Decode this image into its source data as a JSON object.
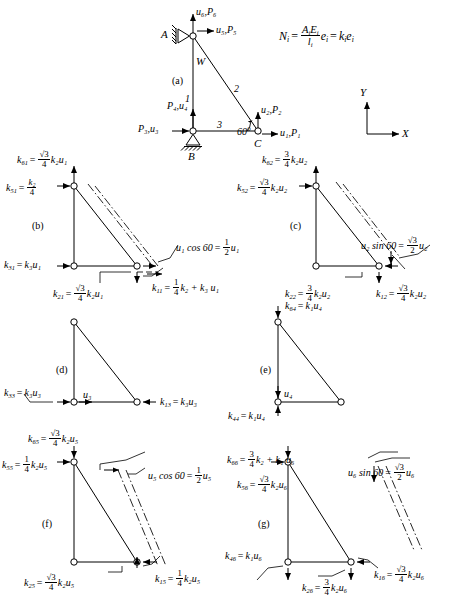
{
  "figure": {
    "axes": {
      "x_label": "X",
      "y_label": "Y"
    },
    "formula": {
      "lhs": "N",
      "lhs_sub": "i",
      "num": "A",
      "num_sub": "i",
      "num2": "E",
      "num2_sub": "i",
      "den": "l",
      "den_sub": "i",
      "mid": "e",
      "mid_sub": "i",
      "rhs": "k",
      "rhs_sub": "i",
      "rhs2": "e",
      "rhs2_sub": "i",
      "plain": "N_i = (A_i E_i / l_i) e_i = k_i e_i"
    },
    "panels": [
      {
        "tag": "(a)",
        "name": "truss-geometry"
      },
      {
        "tag": "(b)",
        "name": "unit-displacement-u1"
      },
      {
        "tag": "(c)",
        "name": "unit-displacement-u2"
      },
      {
        "tag": "(d)",
        "name": "unit-displacement-u3"
      },
      {
        "tag": "(e)",
        "name": "unit-displacement-u4"
      },
      {
        "tag": "(f)",
        "name": "unit-displacement-u5"
      },
      {
        "tag": "(g)",
        "name": "unit-displacement-u6"
      }
    ],
    "panel_a": {
      "node_a": "A",
      "node_b": "B",
      "node_c": "C",
      "member_1": "1",
      "member_2": "2",
      "member_3": "3",
      "weight": "W",
      "angle": "60",
      "angle_unit": "°",
      "dof_top_vertical": "u₆,P₆",
      "dof_top_horizontal": "u₅,P₅",
      "dof_b_vertical": "P₄,u₄",
      "dof_b_horizontal": "P₃,u₃",
      "dof_c_vertical": "u₂,P₂",
      "dof_c_horizontal": "u₁,P₁"
    },
    "panel_b": {
      "k61": {
        "sym": "k",
        "sub": "61",
        "frac_num": "√3",
        "frac_den": "4",
        "tail": "k₂u₁"
      },
      "k51": {
        "sym": "k",
        "sub": "51",
        "frac_num": "k₂",
        "frac_den": "4",
        "tail": ""
      },
      "k31": {
        "sym": "k",
        "sub": "31",
        "tail": "k₃u₁"
      },
      "k21": {
        "sym": "k",
        "sub": "21",
        "frac_num": "√3",
        "frac_den": "4",
        "tail": "k₂u₁"
      },
      "k11": {
        "sym": "k",
        "sub": "11",
        "frac_num": "1",
        "frac_den": "4",
        "tail": "k₂ + k₃  u₁"
      },
      "note": {
        "lhs": "u₁ cos 60",
        "frac_num": "1",
        "frac_den": "2",
        "tail": "u₁"
      }
    },
    "panel_c": {
      "k62": {
        "sym": "k",
        "sub": "62",
        "frac_num": "3",
        "frac_den": "4",
        "tail": "k₂u₂"
      },
      "k52": {
        "sym": "k",
        "sub": "52",
        "frac_num": "√3",
        "frac_den": "4",
        "tail": "k₂u₂"
      },
      "k22": {
        "sym": "k",
        "sub": "22",
        "frac_num": "3",
        "frac_den": "4",
        "tail": "k₂u₂"
      },
      "k12": {
        "sym": "k",
        "sub": "12",
        "frac_num": "√3",
        "frac_den": "4",
        "tail": "k₂u₂"
      },
      "note": {
        "lhs": "u₂ sin 60",
        "frac_num": "√3",
        "frac_den": "2",
        "tail": "u₂"
      }
    },
    "panel_d": {
      "k33": {
        "sym": "k",
        "sub": "33",
        "tail": "k₃u₃"
      },
      "k13": {
        "sym": "k",
        "sub": "13",
        "tail": "k₃u₃"
      },
      "disp": "u₃"
    },
    "panel_e": {
      "k64": {
        "sym": "k",
        "sub": "64",
        "tail": "k₁u₄"
      },
      "k44": {
        "sym": "k",
        "sub": "44",
        "tail": "k₁u₄"
      },
      "disp": "u₄"
    },
    "panel_f": {
      "k65": {
        "sym": "k",
        "sub": "65",
        "frac_num": "√3",
        "frac_den": "4",
        "tail": "k₂u₅"
      },
      "k55": {
        "sym": "k",
        "sub": "55",
        "frac_num": "1",
        "frac_den": "4",
        "tail": "k₂u₅"
      },
      "k25": {
        "sym": "k",
        "sub": "25",
        "frac_num": "√3",
        "frac_den": "4",
        "tail": "k₂u₅"
      },
      "k15": {
        "sym": "k",
        "sub": "15",
        "frac_num": "1",
        "frac_den": "4",
        "tail": "k₂u₅"
      },
      "note": {
        "lhs": "u₅ cos 60",
        "frac_num": "1",
        "frac_den": "2",
        "tail": "u₅"
      }
    },
    "panel_g": {
      "k66": {
        "sym": "k",
        "sub": "66",
        "frac_num": "3",
        "frac_den": "4",
        "tail": "k₂ + k₁  u₆"
      },
      "k56": {
        "sym": "k",
        "sub": "56",
        "frac_num": "√3",
        "frac_den": "4",
        "tail": "k₂u₆"
      },
      "k46": {
        "sym": "k",
        "sub": "46",
        "tail": "k₁u₆"
      },
      "k26": {
        "sym": "k",
        "sub": "26",
        "frac_num": "3",
        "frac_den": "4",
        "tail": "k₂u₆"
      },
      "k16": {
        "sym": "k",
        "sub": "16",
        "frac_num": "√3",
        "frac_den": "4",
        "tail": "k₂u₆"
      },
      "note": {
        "lhs": "u₆ sin 60",
        "frac_num": "√3",
        "frac_den": "2",
        "tail": "u₆"
      }
    },
    "colors": {
      "line": "#000000",
      "background": "#ffffff"
    }
  }
}
